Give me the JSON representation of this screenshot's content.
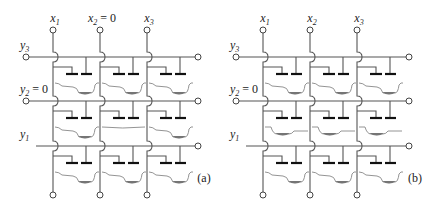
{
  "diagram": {
    "type": "ccd-imaging-array-crossbar",
    "panels": [
      {
        "id": "a",
        "caption": "(a)",
        "columns": [
          {
            "label": "x",
            "sub": "1",
            "suffix": ""
          },
          {
            "label": "x",
            "sub": "2",
            "suffix": " = 0"
          },
          {
            "label": "x",
            "sub": "3",
            "suffix": ""
          }
        ],
        "rows": [
          {
            "label": "y",
            "sub": "3",
            "suffix": ""
          },
          {
            "label": "y",
            "sub": "2",
            "suffix": " = 0"
          },
          {
            "label": "y",
            "sub": "1",
            "suffix": ""
          }
        ],
        "wells": [
          [
            "right",
            "right",
            "right"
          ],
          [
            "right",
            "empty",
            "right"
          ],
          [
            "right",
            "right",
            "right"
          ]
        ]
      },
      {
        "id": "b",
        "caption": "(b)",
        "columns": [
          {
            "label": "x",
            "sub": "1",
            "suffix": ""
          },
          {
            "label": "x",
            "sub": "2",
            "suffix": ""
          },
          {
            "label": "x",
            "sub": "3",
            "suffix": ""
          }
        ],
        "rows": [
          {
            "label": "y",
            "sub": "3",
            "suffix": ""
          },
          {
            "label": "y",
            "sub": "2",
            "suffix": " = 0"
          },
          {
            "label": "y",
            "sub": "1",
            "suffix": ""
          }
        ],
        "wells": [
          [
            "right",
            "right",
            "right"
          ],
          [
            "left",
            "left",
            "left"
          ],
          [
            "right",
            "right",
            "right"
          ]
        ]
      }
    ]
  }
}
